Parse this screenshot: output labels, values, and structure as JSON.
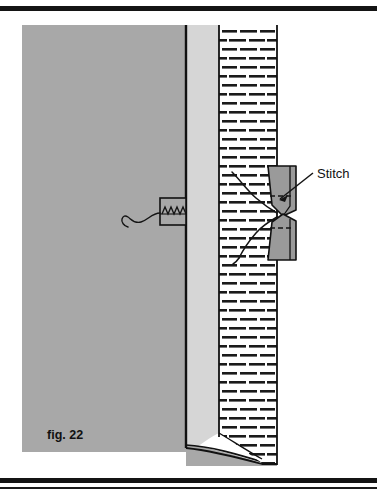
{
  "figure": {
    "caption": "fig. 22",
    "callouts": [
      {
        "id": "stitch",
        "label": "Stitch"
      }
    ],
    "colors": {
      "panel_grey": "#a8a8a8",
      "panel_light_grey": "#d6d6d6",
      "block_grey": "#9a9a9a",
      "outline": "#111111",
      "hatch_background": "#ffffff",
      "hatch_dash": "#1a1a1a",
      "rule_black": "#141414",
      "page_background": "#ffffff"
    },
    "parts": [
      {
        "id": "outer-panel",
        "name": "panel-body"
      },
      {
        "id": "inner-strip",
        "name": "panel-edge-strip"
      },
      {
        "id": "hatched-wall",
        "name": "hatched-section"
      },
      {
        "id": "threaded-insert",
        "name": "threaded-insert-box"
      },
      {
        "id": "thread-tail",
        "name": "thread-tail-curve"
      },
      {
        "id": "stitch-block-upper",
        "name": "stitch-block-upper"
      },
      {
        "id": "stitch-block-lower",
        "name": "stitch-block-lower"
      },
      {
        "id": "stitch-thread",
        "name": "stitch-thread-curve"
      }
    ],
    "hatch": {
      "type": "brick-dash",
      "row_spacing": 9,
      "dash_length": 17,
      "dash_thickness": 3
    }
  }
}
